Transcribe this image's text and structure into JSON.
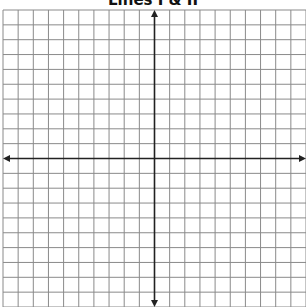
{
  "title": "Lines I & II",
  "grid": {
    "columns": 20,
    "rows": 20,
    "left": 3,
    "top": 10,
    "cell_w": 15.15,
    "cell_h": 14.85,
    "x_axis_row": 10,
    "y_axis_col": 10,
    "grid_color": "#8a8a8a",
    "axis_color": "#222222"
  },
  "chart_data": {
    "type": "coordinate-grid",
    "title": "Lines I & II",
    "xlabel": "",
    "ylabel": "",
    "xlim": [
      -10,
      10
    ],
    "ylim": [
      -10,
      10
    ],
    "grid": true,
    "axes_arrows": true,
    "series": []
  }
}
